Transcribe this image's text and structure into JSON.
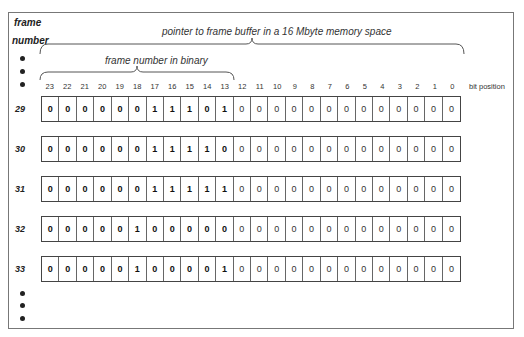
{
  "header": {
    "frame_label_line1": "frame",
    "frame_label_line2": "number",
    "pointer_caption": "pointer to frame buffer in a 16 Mbyte memory space",
    "binary_caption": "frame number in binary",
    "bit_position_label": "bit position"
  },
  "bit_positions": [
    "23",
    "22",
    "21",
    "20",
    "19",
    "18",
    "17",
    "16",
    "15",
    "14",
    "13",
    "12",
    "11",
    "10",
    "9",
    "8",
    "7",
    "6",
    "5",
    "4",
    "3",
    "2",
    "1",
    "0"
  ],
  "rows": [
    {
      "frame": "29",
      "bits": [
        "0",
        "0",
        "0",
        "0",
        "0",
        "0",
        "1",
        "1",
        "1",
        "0",
        "1",
        "0",
        "0",
        "0",
        "0",
        "0",
        "0",
        "0",
        "0",
        "0",
        "0",
        "0",
        "0",
        "0"
      ]
    },
    {
      "frame": "30",
      "bits": [
        "0",
        "0",
        "0",
        "0",
        "0",
        "0",
        "1",
        "1",
        "1",
        "1",
        "0",
        "0",
        "0",
        "0",
        "0",
        "0",
        "0",
        "0",
        "0",
        "0",
        "0",
        "0",
        "0",
        "0"
      ]
    },
    {
      "frame": "31",
      "bits": [
        "0",
        "0",
        "0",
        "0",
        "0",
        "0",
        "1",
        "1",
        "1",
        "1",
        "1",
        "0",
        "0",
        "0",
        "0",
        "0",
        "0",
        "0",
        "0",
        "0",
        "0",
        "0",
        "0",
        "0"
      ]
    },
    {
      "frame": "32",
      "bits": [
        "0",
        "0",
        "0",
        "0",
        "0",
        "1",
        "0",
        "0",
        "0",
        "0",
        "0",
        "0",
        "0",
        "0",
        "0",
        "0",
        "0",
        "0",
        "0",
        "0",
        "0",
        "0",
        "0",
        "0"
      ]
    },
    {
      "frame": "33",
      "bits": [
        "0",
        "0",
        "0",
        "0",
        "0",
        "1",
        "0",
        "0",
        "0",
        "0",
        "1",
        "0",
        "0",
        "0",
        "0",
        "0",
        "0",
        "0",
        "0",
        "0",
        "0",
        "0",
        "0",
        "0"
      ]
    }
  ]
}
